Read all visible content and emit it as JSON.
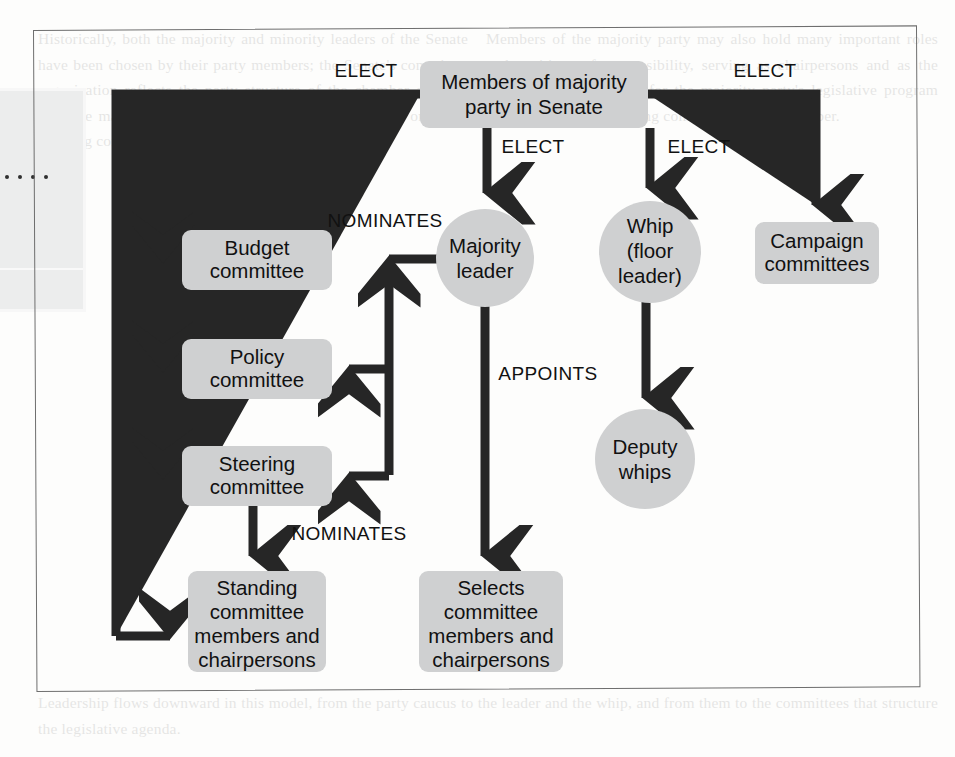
{
  "page": {
    "type": "scanned-textbook-figure",
    "shape_fill": "#cfd0d1",
    "flow_color": "#262626",
    "frame_color": "#6e6e6e",
    "margin_figure_ellipsis": "...."
  },
  "diagram": {
    "nodes": [
      {
        "id": "members",
        "shape": "rounded-rect",
        "line1": "Members of majority",
        "line2": "party in Senate"
      },
      {
        "id": "majority-leader",
        "shape": "circle",
        "line1": "Majority",
        "line2": "leader"
      },
      {
        "id": "whip",
        "shape": "circle",
        "line1": "Whip",
        "line2": "(floor",
        "line3": "leader)"
      },
      {
        "id": "campaign",
        "shape": "rounded-rect",
        "line1": "Campaign",
        "line2": "committees"
      },
      {
        "id": "budget",
        "shape": "rounded-rect",
        "line1": "Budget",
        "line2": "committee"
      },
      {
        "id": "policy",
        "shape": "rounded-rect",
        "line1": "Policy",
        "line2": "committee"
      },
      {
        "id": "steering",
        "shape": "rounded-rect",
        "line1": "Steering",
        "line2": "committee"
      },
      {
        "id": "deputy-whips",
        "shape": "circle",
        "line1": "Deputy",
        "line2": "whips"
      },
      {
        "id": "standing",
        "shape": "rounded-rect",
        "line1": "Standing",
        "line2": "committee",
        "line3": "members and",
        "line4": "chairpersons"
      },
      {
        "id": "selects",
        "shape": "rounded-rect",
        "line1": "Selects",
        "line2": "committee",
        "line3": "members and",
        "line4": "chairpersons"
      }
    ],
    "edge_labels": {
      "elect_left": "ELECT",
      "elect_right": "ELECT",
      "elect_center_left": "ELECT",
      "elect_center_right": "ELECT",
      "nominates_top": "NOMINATES",
      "nominates_bottom": "NOMINATES",
      "appoints": "APPOINTS"
    },
    "edges": [
      {
        "from": "members",
        "to": "budget",
        "label": "ELECT"
      },
      {
        "from": "members",
        "to": "policy",
        "label": "ELECT"
      },
      {
        "from": "members",
        "to": "steering",
        "label": "ELECT"
      },
      {
        "from": "members",
        "to": "standing",
        "label": "ELECT"
      },
      {
        "from": "members",
        "to": "majority-leader",
        "label": "ELECT"
      },
      {
        "from": "members",
        "to": "whip",
        "label": "ELECT"
      },
      {
        "from": "members",
        "to": "campaign",
        "label": "ELECT"
      },
      {
        "from": "majority-leader",
        "to": "budget",
        "label": "NOMINATES"
      },
      {
        "from": "majority-leader",
        "to": "policy",
        "label": "NOMINATES"
      },
      {
        "from": "majority-leader",
        "to": "steering",
        "label": "NOMINATES"
      },
      {
        "from": "majority-leader",
        "to": "selects",
        "label": "APPOINTS"
      },
      {
        "from": "steering",
        "to": "standing",
        "label": "NOMINATES"
      },
      {
        "from": "whip",
        "to": "deputy-whips",
        "label": ""
      }
    ]
  },
  "ghost_text": {
    "left_column": "Historically, both the majority and minority leaders of the Senate have been chosen by their party members; the Senate's committee organization reflects the party structure of the chamber as well, with the majority party holding a majority of the seats on every standing committee of the body.",
    "right_column": "Members of the majority party may also hold many important roles and positions of responsibility, serving as chairpersons and as the principal spokespersons for the majority party's legislative program within each of the standing committees of the chamber.",
    "footer": "Leadership flows downward in this model, from the party caucus to the leader and the whip, and from them to the committees that structure the legislative agenda."
  }
}
